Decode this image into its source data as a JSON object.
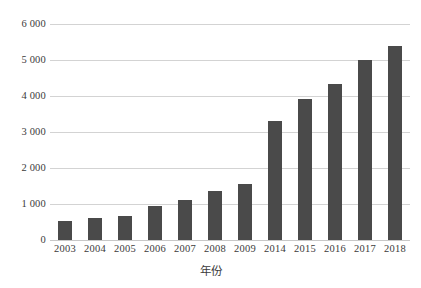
{
  "chart_data": {
    "type": "bar",
    "title": "",
    "xlabel": "年份",
    "ylabel": "",
    "categories": [
      "2003",
      "2004",
      "2005",
      "2006",
      "2007",
      "2008",
      "2009",
      "2014",
      "2015",
      "2016",
      "2017",
      "2018"
    ],
    "values": [
      540,
      600,
      670,
      950,
      1120,
      1370,
      1560,
      3300,
      3920,
      4320,
      5000,
      5400
    ],
    "ylim": [
      0,
      6000
    ],
    "yticks": [
      0,
      1000,
      2000,
      3000,
      4000,
      5000,
      6000
    ],
    "ytick_labels": [
      "0",
      "1 000",
      "2 000",
      "3 000",
      "4 000",
      "5 000",
      "6 000"
    ],
    "grid": true,
    "legend": false,
    "legend_position": "none",
    "bar_color": "#4a4a4a",
    "gridline_color": "#d3d3d3",
    "background_color": "#ffffff",
    "text_color": "#3b3b3b"
  }
}
